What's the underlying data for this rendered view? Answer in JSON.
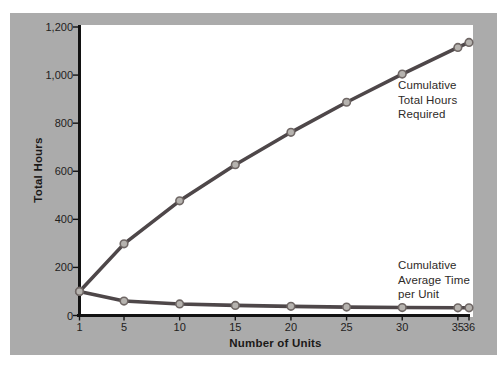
{
  "colors": {
    "page_bg": "#ffffff",
    "panel_bg": "#ababab",
    "plot_bg": "#ffffff",
    "axis": "#121212",
    "line": "#4e4749",
    "marker_fill": "#b6b3af",
    "marker_stroke": "#6f6765",
    "tick_text": "#1f1d1d",
    "annotation_text": "#2e2a27"
  },
  "chart_data": {
    "type": "line",
    "title": "",
    "xlabel": "Number of Units",
    "ylabel": "Total Hours",
    "xlim": [
      1,
      36
    ],
    "ylim": [
      0,
      1200
    ],
    "grid": false,
    "legend_position": "inline-annotations",
    "x_tick_labels": [
      "1",
      "5",
      "10",
      "15",
      "20",
      "25",
      "30",
      "35",
      "36"
    ],
    "x_tick_values": [
      1,
      5,
      10,
      15,
      20,
      25,
      30,
      35,
      36
    ],
    "y_tick_labels": [
      "0",
      "200",
      "400",
      "600",
      "800",
      "1,000",
      "1,200"
    ],
    "y_tick_values": [
      0,
      200,
      400,
      600,
      800,
      1000,
      1200
    ],
    "x": [
      1,
      5,
      10,
      15,
      20,
      25,
      30,
      35,
      36
    ],
    "series": [
      {
        "name": "Cumulative Total Hours Required",
        "values": [
          100,
          298,
          477,
          627,
          762,
          887,
          1004,
          1115,
          1136
        ]
      },
      {
        "name": "Cumulative Average Time per Unit",
        "values": [
          100,
          60,
          48,
          42,
          38,
          35,
          33,
          32,
          32
        ]
      }
    ],
    "annotations": [
      {
        "text": "Cumulative\nTotal Hours\nRequired"
      },
      {
        "text": "Cumulative\nAverage Time\nper Unit"
      }
    ]
  }
}
